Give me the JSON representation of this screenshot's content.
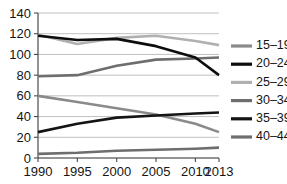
{
  "chart_data": {
    "type": "line",
    "title": "",
    "subtitle": "",
    "xlabel": "",
    "ylabel": "",
    "x": [
      1990,
      1995,
      2000,
      2005,
      2010,
      2013
    ],
    "xtick_labels": [
      "1990",
      "1995",
      "2000",
      "2005",
      "2010",
      "2013"
    ],
    "ytick_labels": [
      "0",
      "20",
      "40",
      "60",
      "80",
      "100",
      "120",
      "140"
    ],
    "yticks": [
      0,
      20,
      40,
      60,
      80,
      100,
      120,
      140
    ],
    "ylim": [
      0,
      140
    ],
    "xlim": [
      1990,
      2013
    ],
    "grid": "horizontal",
    "legend_position": "right",
    "series": [
      {
        "name": "15–19",
        "color": "#8a8a8a",
        "values": [
          60,
          54,
          48,
          42,
          33,
          25
        ]
      },
      {
        "name": "20–24",
        "color": "#0d0d0d",
        "values": [
          118,
          114,
          115,
          108,
          97,
          80
        ]
      },
      {
        "name": "25–29",
        "color": "#b0b0b0",
        "values": [
          119,
          110,
          116,
          118,
          113,
          109
        ]
      },
      {
        "name": "30–34",
        "color": "#6e6e6e",
        "values": [
          79,
          80,
          89,
          95,
          96,
          97
        ]
      },
      {
        "name": "35–39",
        "color": "#141414",
        "values": [
          25,
          33,
          39,
          41,
          43,
          44
        ]
      },
      {
        "name": "40–44",
        "color": "#6e6e6e",
        "values": [
          4,
          5,
          7,
          8,
          9,
          10
        ]
      }
    ]
  },
  "legend": {
    "entries": [
      "15–19",
      "20–24",
      "25–29",
      "30–34",
      "35–39",
      "40–44"
    ]
  }
}
